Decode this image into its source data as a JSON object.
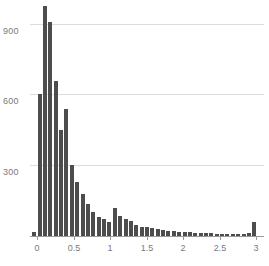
{
  "chart_data": {
    "type": "bar",
    "title": "",
    "subtitle": "",
    "xlabel": "",
    "ylabel": "",
    "legend": [],
    "grid": "horizontal-only",
    "legend_position": "none",
    "bar_color": "#4d4d4d",
    "gridline_color": "#dcdcdc",
    "axis_color": "#9a9a9a",
    "tick_label_color": "#7a7a7a",
    "xlim": [
      -0.12,
      3.12
    ],
    "ylim": [
      0,
      1010
    ],
    "xticks": [
      0,
      0.5,
      1,
      1.5,
      2,
      2.5,
      3
    ],
    "xtick_labels": [
      "0",
      "0.5",
      "1",
      "1.5",
      "2",
      "2.5",
      "3"
    ],
    "yticks": [
      300,
      600,
      900
    ],
    "ytick_labels": [
      "300",
      "600",
      "900"
    ],
    "bin_width": 0.0735,
    "x": [
      -0.037,
      0.037,
      0.11,
      0.184,
      0.257,
      0.331,
      0.404,
      0.478,
      0.551,
      0.625,
      0.698,
      0.772,
      0.845,
      0.919,
      0.992,
      1.066,
      1.139,
      1.213,
      1.286,
      1.36,
      1.433,
      1.507,
      1.58,
      1.654,
      1.727,
      1.801,
      1.874,
      1.948,
      2.021,
      2.095,
      2.168,
      2.242,
      2.315,
      2.389,
      2.462,
      2.536,
      2.609,
      2.683,
      2.756,
      2.83,
      2.903,
      2.977
    ],
    "values": [
      18,
      600,
      975,
      908,
      655,
      450,
      540,
      300,
      230,
      180,
      135,
      100,
      82,
      70,
      58,
      120,
      85,
      72,
      64,
      48,
      40,
      38,
      32,
      28,
      26,
      22,
      20,
      18,
      16,
      15,
      14,
      13,
      12,
      11,
      10,
      9,
      8,
      8,
      7,
      10,
      12,
      59
    ]
  }
}
